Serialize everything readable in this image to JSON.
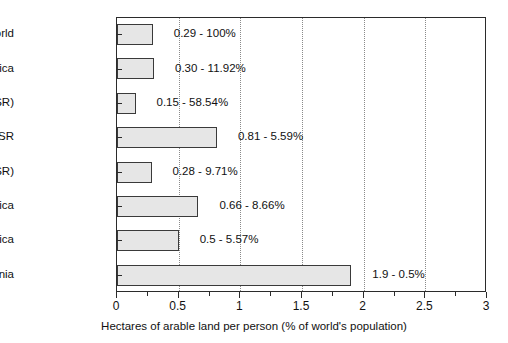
{
  "chart_data": {
    "type": "bar",
    "orientation": "horizontal",
    "title": "",
    "xlabel": "Hectares of arable land per person (% of world's population)",
    "ylabel": "",
    "xlim": [
      0,
      3
    ],
    "ylim": [
      0,
      8
    ],
    "grid": "vertical-dotted",
    "legend": "none",
    "xticks": [
      0,
      0.5,
      1,
      1.5,
      2,
      2.5,
      3
    ],
    "xtick_labels": [
      "0",
      "0.5",
      "1",
      "1.5",
      "2",
      "2.5",
      "3"
    ],
    "x_minor_ticks": [
      0.25,
      0.75,
      1.25,
      1.75,
      2.25,
      2.75
    ],
    "categories": [
      "World",
      "Africa",
      "Asia(-USSR)",
      "USSR",
      "Europe(-USSR)",
      "N and C America",
      "S. America",
      "Oceania"
    ],
    "values": [
      0.29,
      0.3,
      0.15,
      0.81,
      0.28,
      0.66,
      0.5,
      1.9
    ],
    "percentages": [
      "100%",
      "11.92%",
      "58.54%",
      "5.59%",
      "9.71%",
      "8.66%",
      "5.57%",
      "0.5%"
    ],
    "data_labels": [
      "0.29 - 100%",
      "0.30 - 11.92%",
      "0.15 - 58.54%",
      "0.81 - 5.59%",
      "0.28 - 9.71%",
      "0.66 - 8.66%",
      "0.5 - 5.57%",
      "1.9 - 0.5%"
    ],
    "colors": {
      "bar_fill": "#e6e6e6",
      "bar_edge": "#3a3a3a",
      "axis": "#2b2b2b",
      "grid": "#8a8a8a",
      "text": "#111111",
      "background": "#ffffff"
    }
  }
}
